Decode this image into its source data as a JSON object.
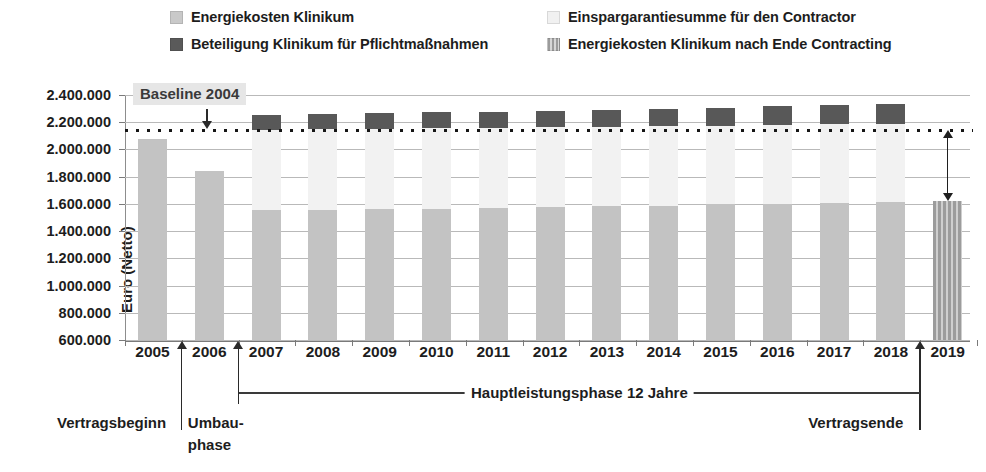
{
  "chart_data": {
    "type": "bar",
    "title": "",
    "xlabel": "",
    "ylabel": "Euro (Netto)",
    "ylim": [
      600000,
      2400000
    ],
    "ytick_step": 200000,
    "yticks": [
      "600.000",
      "800.000",
      "1.000.000",
      "1.200.000",
      "1.400.000",
      "1.600.000",
      "1.800.000",
      "2.000.000",
      "2.200.000",
      "2.400.000"
    ],
    "grid": true,
    "stacked": true,
    "legend_position": "top",
    "categories": [
      "2005",
      "2006",
      "2007",
      "2008",
      "2009",
      "2010",
      "2011",
      "2012",
      "2013",
      "2014",
      "2015",
      "2016",
      "2017",
      "2018",
      "2019"
    ],
    "series": [
      {
        "name": "Energiekosten Klinikum",
        "color": "#c3c3c3",
        "values": [
          2080000,
          1845000,
          1555000,
          1557000,
          1562000,
          1566000,
          1572000,
          1578000,
          1582000,
          1586000,
          1596000,
          1602000,
          1608000,
          1612000,
          null
        ]
      },
      {
        "name": "Einspargarantiesumme für den Contractor",
        "color": "#f2f2f2",
        "values": [
          null,
          null,
          590000,
          592000,
          590000,
          590000,
          588000,
          586000,
          586000,
          586000,
          580000,
          578000,
          576000,
          576000,
          null
        ]
      },
      {
        "name": "Beteiligung Klinikum für Pflichtmaßnahmen",
        "color": "#585858",
        "values": [
          null,
          null,
          110000,
          112000,
          114000,
          116000,
          118000,
          120000,
          124000,
          128000,
          132000,
          136000,
          140000,
          144000,
          null
        ]
      },
      {
        "name": "Energiekosten Klinikum nach Ende Contracting",
        "color": "#9c9c9c",
        "values": [
          null,
          null,
          null,
          null,
          null,
          null,
          null,
          null,
          null,
          null,
          null,
          null,
          null,
          null,
          1620000
        ]
      }
    ],
    "reference_line": {
      "label": "Baseline 2004",
      "value": 2140000,
      "style": "dotted"
    },
    "annotations": [
      {
        "text": "Vertragsbeginn",
        "at": "2005/2006"
      },
      {
        "text": "Umbau-",
        "at": "2006"
      },
      {
        "text": "phase",
        "at": "2006"
      },
      {
        "text": "Hauptleistungsphase 12 Jahre",
        "at": "2007-2018"
      },
      {
        "text": "Vertragsende",
        "at": "2018/2019"
      }
    ]
  },
  "legend": {
    "items": [
      {
        "label": "Energiekosten Klinikum",
        "swatch": "energiekosten-swatch"
      },
      {
        "label": "Beteiligung Klinikum für Pflichtmaßnahmen",
        "swatch": "beteiligung-swatch"
      },
      {
        "label": "Einspargarantiesumme für den Contractor",
        "swatch": "einspargarantiesumme-swatch"
      },
      {
        "label": "Energiekosten Klinikum nach Ende Contracting",
        "swatch": "nach-ende-contracting-swatch"
      }
    ]
  },
  "axis": {
    "y_title": "Euro (Netto)",
    "y_ticks": [
      "2.400.000",
      "2.200.000",
      "2.000.000",
      "1.800.000",
      "1.600.000",
      "1.400.000",
      "1.200.000",
      "1.000.000",
      "800.000",
      "600.000"
    ],
    "x_ticks": [
      "2005",
      "2006",
      "2007",
      "2008",
      "2009",
      "2010",
      "2011",
      "2012",
      "2013",
      "2014",
      "2015",
      "2016",
      "2017",
      "2018",
      "2019"
    ]
  },
  "callout": {
    "baseline_label": "Baseline 2004"
  },
  "footer": {
    "vertragsbeginn": "Vertragsbeginn",
    "umbau_line1": "Umbau-",
    "umbau_line2": "phase",
    "hauptleistungsphase": "Hauptleistungsphase 12 Jahre",
    "vertragsende": "Vertragsende"
  }
}
